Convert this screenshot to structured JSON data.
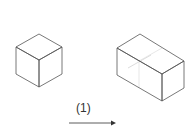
{
  "diagram": {
    "step_label": "(1)",
    "left_shape": "cube",
    "right_shape": "rectangular-prism-two-cubes",
    "arrow": "right-arrow",
    "line_color": "#555555",
    "faint_line_color": "#cccccc"
  }
}
